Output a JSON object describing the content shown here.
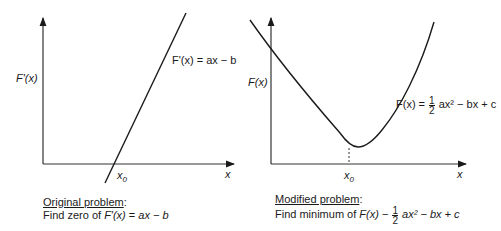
{
  "left_panel": {
    "y_axis_label": "F'(x)",
    "x_axis_label": "x",
    "root_label": "x0",
    "root_label_base": "x",
    "root_label_sub": "0",
    "curve_label": "F'(x) = ax − b",
    "caption_title": "Original problem",
    "caption_text_prefix": "Find zero of ",
    "caption_text_fn": "F'(x)",
    "caption_text_eq": " = ",
    "caption_text_expr": "ax − b",
    "caption_colon": ":"
  },
  "right_panel": {
    "y_axis_label": "F(x)",
    "x_axis_label": "x",
    "min_label_base": "x",
    "min_label_sub": "0",
    "curve_label_fn": "F(x) = ",
    "curve_label_frac_num": "1",
    "curve_label_frac_den": "2",
    "curve_label_rest": " ax² − bx + c",
    "caption_title": "Modified problem",
    "caption_colon": ":",
    "caption_text_prefix": "Find minimum of ",
    "caption_text_fn": "F(x)",
    "caption_text_eq": " − ",
    "caption_frac_num": "1",
    "caption_frac_den": "2",
    "caption_text_expr": " ax² − bx + c"
  }
}
